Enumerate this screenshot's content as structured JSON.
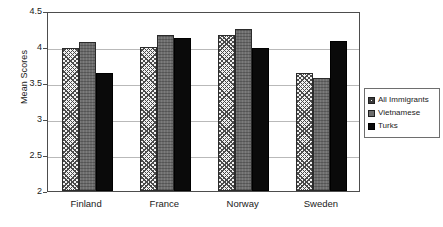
{
  "chart_data": {
    "type": "bar",
    "title": "",
    "xlabel": "",
    "ylabel": "Mean Scores",
    "categories": [
      "Finland",
      "France",
      "Norway",
      "Sweden"
    ],
    "series": [
      {
        "name": "All Immigrants",
        "values": [
          3.98,
          4.0,
          4.17,
          3.64
        ],
        "color": "#f2f2f2",
        "pattern": "cross-hatch"
      },
      {
        "name": "Vietnamese",
        "values": [
          4.07,
          4.16,
          4.25,
          3.57
        ],
        "color": "#6d6d6d",
        "pattern": "solid-gray"
      },
      {
        "name": "Turks",
        "values": [
          3.64,
          4.13,
          3.99,
          4.08
        ],
        "color": "#0a0a0a",
        "pattern": "solid-black"
      }
    ],
    "ylim": [
      2,
      4.5
    ],
    "ytick_labels": [
      "4.5",
      "4",
      "3.5",
      "3",
      "2.5",
      "2"
    ],
    "ytick_values": [
      4.5,
      4,
      3.5,
      3,
      2.5,
      2
    ],
    "grid": true,
    "legend_position": "right",
    "legend_entries": [
      "All Immigrants",
      "Vietnamese",
      "Turks"
    ]
  }
}
